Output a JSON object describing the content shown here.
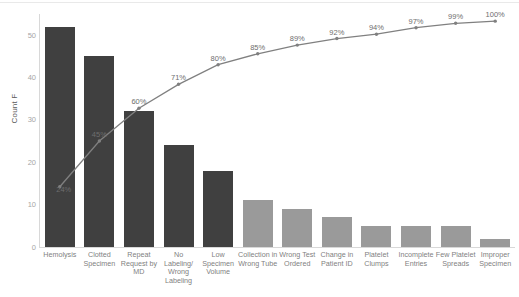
{
  "chart_data": {
    "type": "bar",
    "title": "",
    "subtitle": "",
    "xlabel": "",
    "ylabel": "Count F",
    "ylim": [
      0,
      55
    ],
    "yticks": [
      0,
      10,
      20,
      30,
      40,
      50
    ],
    "ytick_labels": [
      "0",
      "10",
      "20",
      "30",
      "40",
      "50"
    ],
    "grid": false,
    "legend": "none",
    "categories": [
      "Hemolysis",
      "Clotted Specimen",
      "Repeat Request by MD",
      "No Labeling/ Wrong Labeling",
      "Low Specimen Volume",
      "Collection in Wrong Tube",
      "Wrong Test Ordered",
      "Change in Patient ID",
      "Platelet Clumps",
      "Incomplete Entries",
      "Few Platelet Spreads",
      "Improper Specimen"
    ],
    "series": [
      {
        "name": "Count",
        "type": "bar",
        "values": [
          52,
          45,
          32,
          24,
          18,
          11,
          9,
          7,
          5,
          5,
          5,
          2
        ]
      },
      {
        "name": "Cumulative %",
        "type": "line",
        "values": [
          24,
          45,
          60,
          71,
          80,
          85,
          89,
          92,
          94,
          97,
          99,
          100
        ],
        "labels": [
          "24%",
          "45%",
          "60%",
          "71%",
          "80%",
          "85%",
          "89%",
          "92%",
          "94%",
          "97%",
          "99%",
          "100%"
        ]
      }
    ],
    "colors": {
      "bar_primary": "#404040",
      "bar_secondary": "#9a9a9a",
      "line": "#808080",
      "axis": "#d8d8d8",
      "tick_text": "#a6a6a6",
      "category_text": "#7f7f7f",
      "label_text": "#6e6e6e"
    },
    "bar_color_index": [
      0,
      0,
      0,
      0,
      0,
      1,
      1,
      1,
      1,
      1,
      1,
      1
    ]
  }
}
